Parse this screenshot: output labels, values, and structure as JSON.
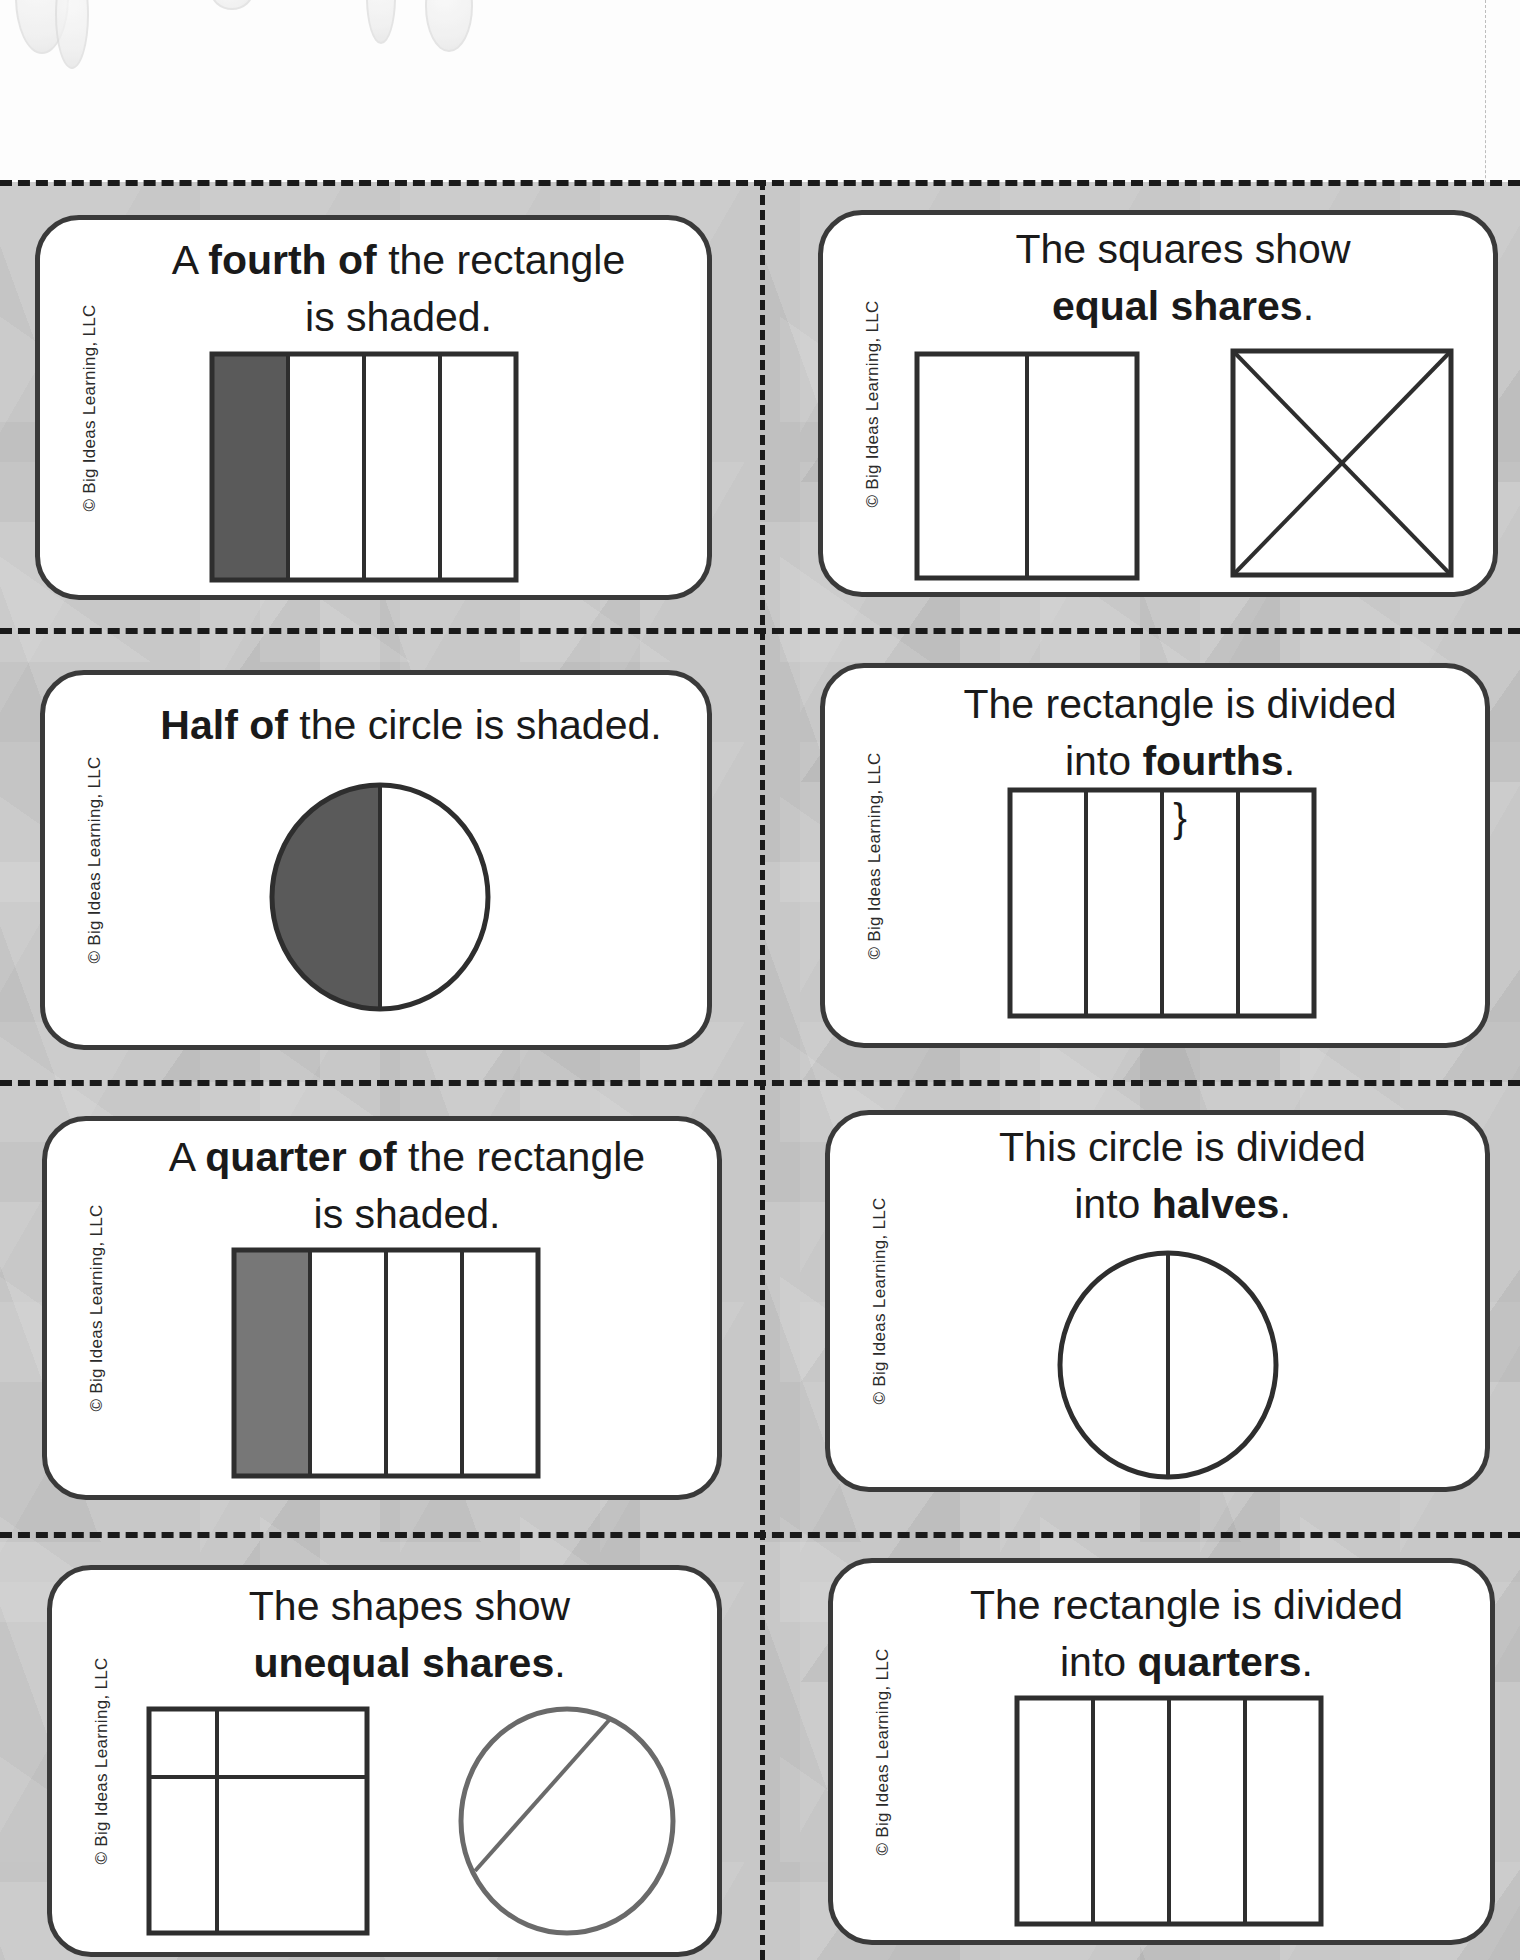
{
  "page": {
    "copyright": "© Big Ideas Learning, LLC",
    "colors": {
      "card_border": "#3a3a3a",
      "shade": "#5a5a5a",
      "light_shade": "#777777",
      "background": "#c8c8c8",
      "cut_line": "#1a1a1a"
    }
  },
  "cards": [
    {
      "id": "fourth-of-rectangle",
      "line1_pre": "A ",
      "line1_bold": "fourth of",
      "line1_post": " the rectangle",
      "line2_pre": "is shaded.",
      "line2_bold": "",
      "line2_post": "",
      "figure": "rectangle divided into 4 vertical parts, first part shaded"
    },
    {
      "id": "equal-shares",
      "line1_pre": "The squares show",
      "line1_bold": "",
      "line1_post": "",
      "line2_pre": "",
      "line2_bold": "equal shares",
      "line2_post": ".",
      "figure": "square split into 2 halves; square split diagonally into 4 triangles"
    },
    {
      "id": "half-of-circle",
      "line1_pre": "",
      "line1_bold": "Half of",
      "line1_post": " the circle is shaded.",
      "line2_pre": "",
      "line2_bold": "",
      "line2_post": "",
      "figure": "circle split vertically, left half shaded"
    },
    {
      "id": "fourths",
      "line1_pre": "The rectangle is divided",
      "line1_bold": "",
      "line1_post": "",
      "line2_pre": "into ",
      "line2_bold": "fourths",
      "line2_post": ".",
      "figure": "rectangle divided into 4 vertical parts"
    },
    {
      "id": "quarter-of-rectangle",
      "line1_pre": "A ",
      "line1_bold": "quarter of",
      "line1_post": " the rectangle",
      "line2_pre": "is shaded.",
      "line2_bold": "",
      "line2_post": "",
      "figure": "rectangle divided into 4 vertical parts, first part shaded"
    },
    {
      "id": "halves",
      "line1_pre": "This circle is divided",
      "line1_bold": "",
      "line1_post": "",
      "line2_pre": "into ",
      "line2_bold": "halves",
      "line2_post": ".",
      "figure": "circle split vertically into 2 halves"
    },
    {
      "id": "unequal-shares",
      "line1_pre": "The shapes show",
      "line1_bold": "",
      "line1_post": "",
      "line2_pre": "",
      "line2_bold": "unequal shares",
      "line2_post": ".",
      "figure": "rectangle split unequally into 4 parts; circle split by off-center chord"
    },
    {
      "id": "quarters",
      "line1_pre": "The rectangle is divided",
      "line1_bold": "",
      "line1_post": "",
      "line2_pre": "into ",
      "line2_bold": "quarters",
      "line2_post": ".",
      "figure": "rectangle divided into 4 vertical parts"
    }
  ]
}
